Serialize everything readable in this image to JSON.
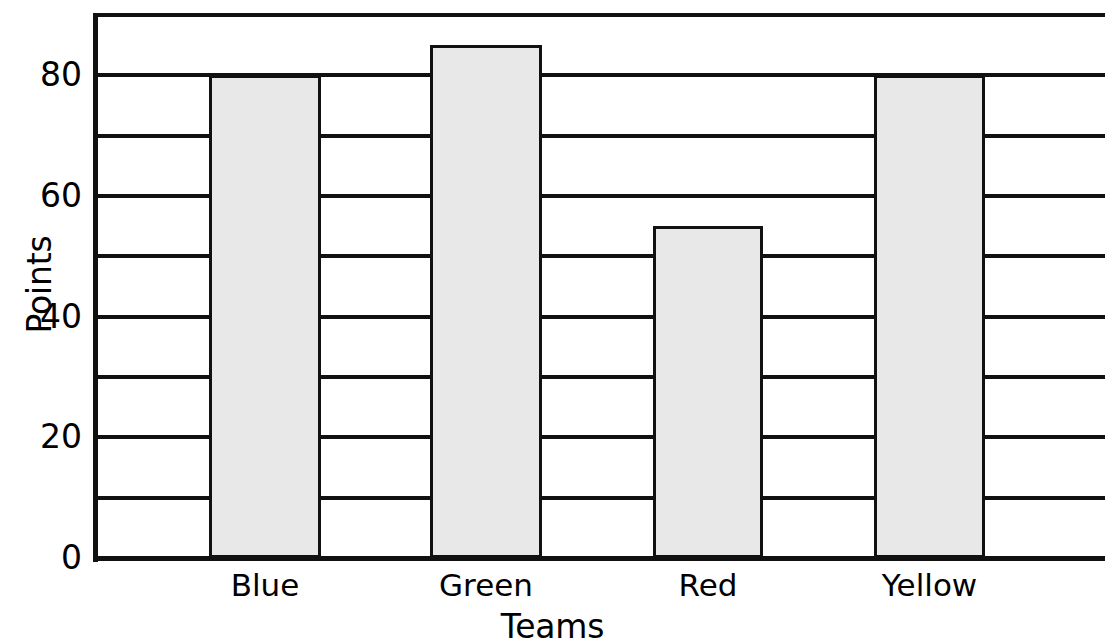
{
  "chart_data": {
    "type": "bar",
    "title": "",
    "categories": [
      "Blue",
      "Green",
      "Red",
      "Yellow"
    ],
    "values": [
      80,
      85,
      55,
      80
    ],
    "series": [
      {
        "name": "Points",
        "values": [
          80,
          85,
          55,
          80
        ]
      }
    ],
    "xlabel": "Teams",
    "ylabel": "Points",
    "ylim": [
      0,
      90
    ],
    "ytick_labels": [
      "0",
      "20",
      "40",
      "60",
      "80"
    ],
    "ytick_values": [
      0,
      20,
      40,
      60,
      80
    ],
    "gridlines": [
      0,
      10,
      20,
      30,
      40,
      50,
      60,
      70,
      80,
      90
    ],
    "grid": true,
    "grid_axis": "y",
    "legend": false,
    "bar_fill_color": "#e8e8e8",
    "bar_edge_color": "#111111",
    "axis_color": "#111111",
    "background_color": "#ffffff"
  },
  "axes": {
    "y_title": "Points",
    "x_title": "Teams"
  },
  "bars": [
    {
      "label": "Blue",
      "value": 80
    },
    {
      "label": "Green",
      "value": 85
    },
    {
      "label": "Red",
      "value": 55
    },
    {
      "label": "Yellow",
      "value": 80
    }
  ],
  "ticks": {
    "y": [
      {
        "label": "80",
        "value": 80
      },
      {
        "label": "60",
        "value": 60
      },
      {
        "label": "40",
        "value": 40
      },
      {
        "label": "20",
        "value": 20
      },
      {
        "label": "0",
        "value": 0
      }
    ]
  }
}
